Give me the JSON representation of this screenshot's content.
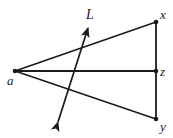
{
  "figure": {
    "type": "geometry-diagram",
    "background_color": "#ffffff",
    "stroke_color": "#1a1a1a",
    "width": 173,
    "height": 138,
    "points": [
      {
        "id": "a",
        "label": "a",
        "x": 15,
        "y": 71,
        "label_x": 7,
        "label_y": 85,
        "dot": true
      },
      {
        "id": "x",
        "label": "x",
        "x": 156,
        "y": 22,
        "label_x": 160,
        "label_y": 19,
        "dot": true
      },
      {
        "id": "z",
        "label": "z",
        "x": 156,
        "y": 71,
        "label_x": 160,
        "label_y": 74,
        "dot": true
      },
      {
        "id": "y",
        "label": "y",
        "x": 156,
        "y": 119,
        "label_x": 160,
        "label_y": 130,
        "dot": true
      }
    ],
    "segments": [
      {
        "id": "a-x",
        "from": "a",
        "to": "x",
        "x1": 15,
        "y1": 71,
        "x2": 156,
        "y2": 22
      },
      {
        "id": "a-z",
        "from": "a",
        "to": "z",
        "x1": 15,
        "y1": 71,
        "x2": 156,
        "y2": 71
      },
      {
        "id": "a-y",
        "from": "a",
        "to": "y",
        "x1": 15,
        "y1": 71,
        "x2": 156,
        "y2": 119
      },
      {
        "id": "x-y",
        "from": "x",
        "to": "y",
        "x1": 156,
        "y1": 22,
        "x2": 156,
        "y2": 119
      }
    ],
    "lines": [
      {
        "id": "L",
        "label": "L",
        "label_x": 86,
        "label_y": 19,
        "x1": 58,
        "y1": 122,
        "x2": 88,
        "y2": 28,
        "double_arrow": true
      }
    ]
  }
}
